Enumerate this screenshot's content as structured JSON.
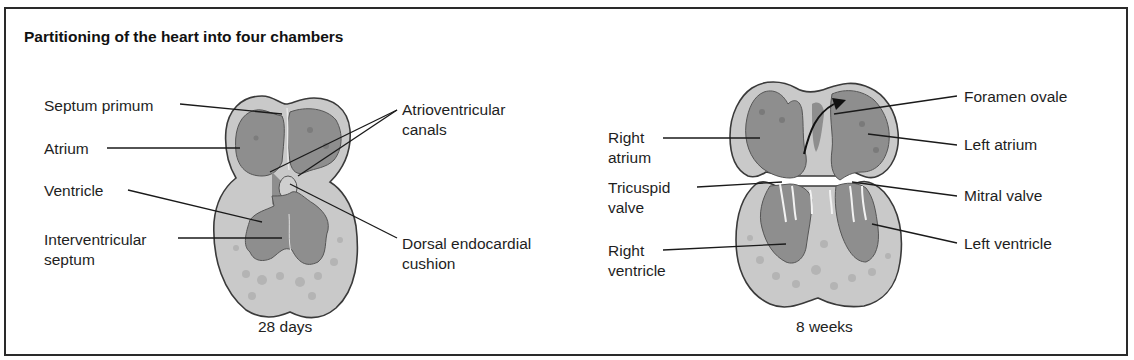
{
  "title": "Partitioning of the heart into four chambers",
  "colors": {
    "outer_tissue": "#c9c9c9",
    "chamber": "#8e8e8e",
    "chamber_spots": "#7a7a7a",
    "cushion": "#bdbdbd",
    "outline": "#3a3a3a",
    "leader_line": "#1a1a1a"
  },
  "panels": [
    {
      "caption": "28 days",
      "labels": {
        "septum_primum": "Septum primum",
        "atrium": "Atrium",
        "ventricle": "Ventricle",
        "interventricular_septum": "Interventricular\nseptum",
        "atrioventricular_canals": "Atrioventricular\ncanals",
        "dorsal_endocardial_cushion": "Dorsal endocardial\ncushion"
      }
    },
    {
      "caption": "8 weeks",
      "labels": {
        "right_atrium": "Right\natrium",
        "tricuspid_valve": "Tricuspid\nvalve",
        "right_ventricle": "Right\nventricle",
        "foramen_ovale": "Foramen ovale",
        "left_atrium": "Left atrium",
        "mitral_valve": "Mitral valve",
        "left_ventricle": "Left ventricle"
      }
    }
  ]
}
